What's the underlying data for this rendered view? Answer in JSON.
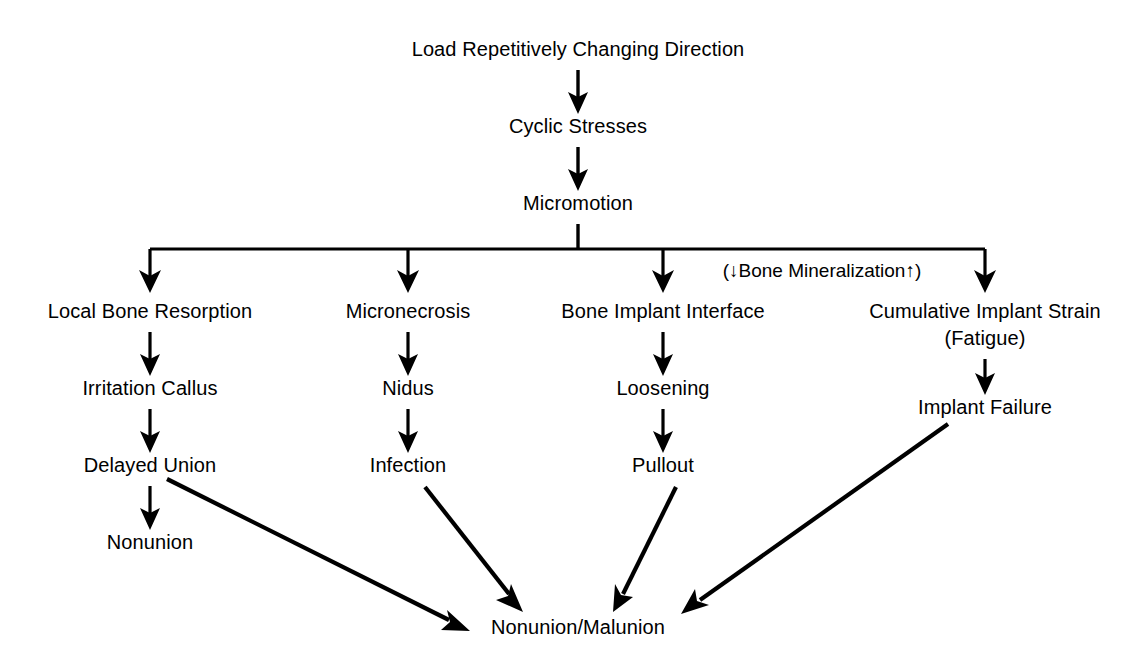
{
  "diagram": {
    "title_node": "Load Repetitively Changing Direction",
    "annotation": "(↓Bone Mineralization↑)",
    "terminal": "Nonunion/Malunion",
    "colors": {
      "ink": "#000000",
      "background": "#ffffff"
    },
    "chain_top": [
      {
        "id": "load",
        "label": "Load Repetitively Changing Direction",
        "x": 578,
        "y": 56
      },
      {
        "id": "cyclic",
        "label": "Cyclic Stresses",
        "x": 578,
        "y": 133
      },
      {
        "id": "micromotion",
        "label": "Micromotion",
        "x": 578,
        "y": 210
      }
    ],
    "branches": [
      {
        "id": "branch-1",
        "x": 150,
        "nodes": [
          {
            "id": "local-bone-resorption",
            "label": "Local Bone Resorption",
            "x": 150,
            "y": 318
          },
          {
            "id": "irritation-callus",
            "label": "Irritation Callus",
            "x": 150,
            "y": 395
          },
          {
            "id": "delayed-union",
            "label": "Delayed Union",
            "x": 150,
            "y": 472
          },
          {
            "id": "nonunion",
            "label": "Nonunion",
            "x": 150,
            "y": 549
          }
        ]
      },
      {
        "id": "branch-2",
        "x": 408,
        "nodes": [
          {
            "id": "micronecrosis",
            "label": "Micronecrosis",
            "x": 408,
            "y": 318
          },
          {
            "id": "nidus",
            "label": "Nidus",
            "x": 408,
            "y": 395
          },
          {
            "id": "infection",
            "label": "Infection",
            "x": 408,
            "y": 472
          }
        ]
      },
      {
        "id": "branch-3",
        "x": 663,
        "nodes": [
          {
            "id": "bone-implant-interface",
            "label": "Bone Implant Interface",
            "x": 663,
            "y": 318
          },
          {
            "id": "loosening",
            "label": "Loosening",
            "x": 663,
            "y": 395
          },
          {
            "id": "pullout",
            "label": "Pullout",
            "x": 663,
            "y": 472
          }
        ]
      },
      {
        "id": "branch-4",
        "x": 985,
        "nodes": [
          {
            "id": "cumulative-implant-strain",
            "label": "Cumulative Implant Strain",
            "x": 985,
            "y": 318
          },
          {
            "id": "fatigue",
            "label": "(Fatigue)",
            "x": 985,
            "y": 345
          },
          {
            "id": "implant-failure",
            "label": "Implant Failure",
            "x": 985,
            "y": 414
          }
        ]
      }
    ],
    "terminal_node": {
      "id": "nonunion-malunion",
      "label": "Nonunion/Malunion",
      "x": 578,
      "y": 634
    },
    "annotation_node": {
      "id": "bone-mineralization-note",
      "label": "(↓Bone Mineralization↑)",
      "x": 822,
      "y": 277
    }
  }
}
